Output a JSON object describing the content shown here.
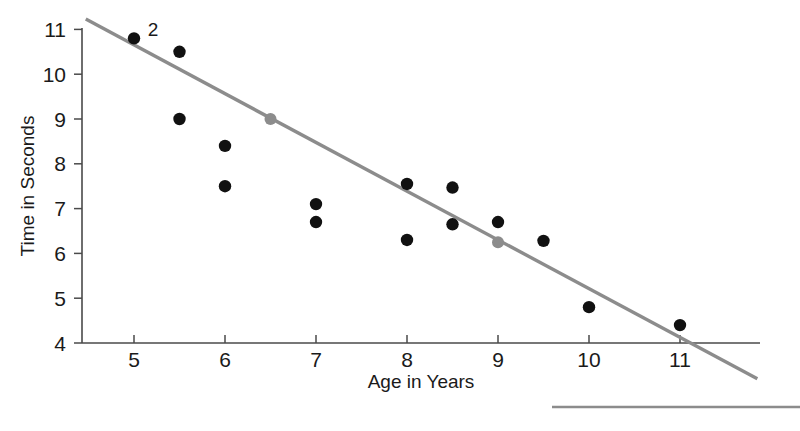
{
  "chart_data": {
    "type": "scatter",
    "title": "",
    "xlabel": "Age in Years",
    "ylabel": "Time in Seconds",
    "xlim": [
      4.45,
      11.8
    ],
    "ylim": [
      4,
      11.25
    ],
    "xticks": [
      5,
      6,
      7,
      8,
      9,
      10,
      11
    ],
    "yticks": [
      4,
      5,
      6,
      7,
      8,
      9,
      10,
      11
    ],
    "grid": false,
    "legend": "none",
    "points": [
      {
        "x": 5,
        "y": 10.8,
        "color": "#111111",
        "label": "2"
      },
      {
        "x": 5.5,
        "y": 10.5,
        "color": "#111111"
      },
      {
        "x": 5.5,
        "y": 9.0,
        "color": "#111111"
      },
      {
        "x": 6,
        "y": 8.4,
        "color": "#111111"
      },
      {
        "x": 6,
        "y": 7.5,
        "color": "#111111"
      },
      {
        "x": 7,
        "y": 7.1,
        "color": "#111111"
      },
      {
        "x": 7,
        "y": 6.7,
        "color": "#111111"
      },
      {
        "x": 8,
        "y": 7.55,
        "color": "#111111"
      },
      {
        "x": 8,
        "y": 6.3,
        "color": "#111111"
      },
      {
        "x": 8.5,
        "y": 7.47,
        "color": "#111111"
      },
      {
        "x": 8.5,
        "y": 6.65,
        "color": "#111111"
      },
      {
        "x": 9,
        "y": 6.7,
        "color": "#111111"
      },
      {
        "x": 9.5,
        "y": 6.28,
        "color": "#111111"
      },
      {
        "x": 10,
        "y": 4.8,
        "color": "#111111"
      },
      {
        "x": 11,
        "y": 4.4,
        "color": "#111111"
      }
    ],
    "line_markers": [
      {
        "x": 6.5,
        "y": 9.0,
        "color": "#8c8c8c"
      },
      {
        "x": 9.0,
        "y": 6.25,
        "color": "#8c8c8c"
      }
    ],
    "trend_line": {
      "color": "#8c8c8c",
      "x_start": 4.47,
      "y_start": 11.23,
      "x_end": 11.85,
      "y_end": 3.2
    },
    "annotations": [
      {
        "text": "2",
        "x": 5.15,
        "y": 11.0
      }
    ],
    "footer_rule": {
      "color": "#8c8c8c",
      "x_start": 552,
      "x_end": 800,
      "y": 407
    }
  },
  "axis": {
    "x_tick_labels": [
      "5",
      "6",
      "7",
      "8",
      "9",
      "10",
      "11"
    ],
    "y_tick_labels": [
      "4",
      "5",
      "6",
      "7",
      "8",
      "9",
      "10",
      "11"
    ],
    "x_title": "Age in Years",
    "y_title": "Time in Seconds"
  },
  "colors": {
    "point": "#111111",
    "trend": "#8c8c8c",
    "axis": "#4a4a4a",
    "background": "#ffffff"
  }
}
